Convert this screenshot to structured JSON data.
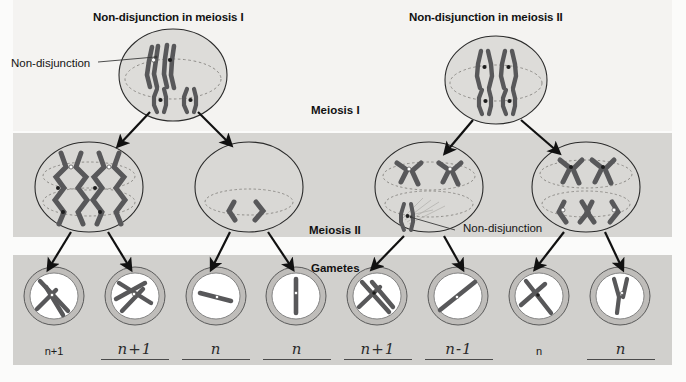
{
  "figure": {
    "kind": "biology-diagram",
    "bands": {
      "top_bg": "#f4f3f1",
      "meiosis2_bg": "#d6d5d2",
      "gametes_bg": "#d1d0cd"
    },
    "ink": "#141414",
    "chromosome_color": "#58585a",
    "membrane_color": "#bfbdba"
  },
  "titles": {
    "left": "Non-disjunction in meiosis I",
    "right": "Non-disjunction in meiosis II"
  },
  "stage_labels": {
    "meiosis_1": "Meiosis I",
    "meiosis_2": "Meiosis II",
    "gametes": "Gametes"
  },
  "callouts": [
    {
      "id": "callout-left",
      "text": "Non-disjunction"
    },
    {
      "id": "callout-right",
      "text": "Non-disjunction"
    }
  ],
  "gametes": [
    {
      "id": "gamete-1",
      "label": "n+1",
      "style": "print"
    },
    {
      "id": "gamete-2",
      "label": "n+1",
      "style": "hand"
    },
    {
      "id": "gamete-3",
      "label": "n",
      "style": "hand"
    },
    {
      "id": "gamete-4",
      "label": "n",
      "style": "hand"
    },
    {
      "id": "gamete-5",
      "label": "n+1",
      "style": "hand"
    },
    {
      "id": "gamete-6",
      "label": "n-1",
      "style": "hand"
    },
    {
      "id": "gamete-7",
      "label": "n",
      "style": "print"
    },
    {
      "id": "gamete-8",
      "label": "n",
      "style": "hand"
    }
  ]
}
